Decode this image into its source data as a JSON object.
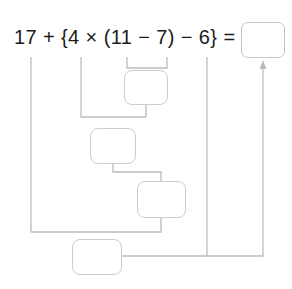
{
  "worksheet": {
    "type": "order-of-operations-worksheet",
    "expression": "17 + {4 × (11 − 7) − 6} =",
    "expression_parts": {
      "operand_1": "17",
      "operator_1": "+",
      "brace_open": "{",
      "operand_2": "4",
      "operator_2": "×",
      "paren_open": "(",
      "operand_3": "11",
      "operator_3": "−",
      "operand_4": "7",
      "paren_close": ")",
      "operator_4": "−",
      "operand_5": "6",
      "brace_close": "}",
      "equals": "="
    },
    "answer_box": {
      "label": "answer",
      "value": ""
    },
    "work_boxes": [
      {
        "step": 1,
        "label": "step-1-parentheses",
        "value": ""
      },
      {
        "step": 2,
        "label": "step-2-multiplication",
        "value": ""
      },
      {
        "step": 3,
        "label": "step-3-subtraction",
        "value": ""
      },
      {
        "step": 4,
        "label": "step-4-addition",
        "value": ""
      }
    ],
    "colors": {
      "ink": "#1b1b1b",
      "box_border": "#cacdd0",
      "wire": "#b9bdc0",
      "background": "#ffffff"
    }
  }
}
